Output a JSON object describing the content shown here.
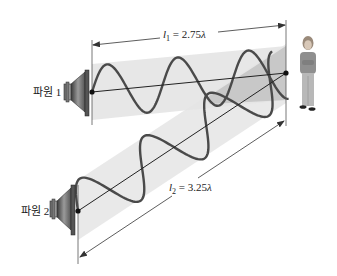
{
  "sources": [
    {
      "id": "source-1",
      "label": "파원 1"
    },
    {
      "id": "source-2",
      "label": "파원 2"
    }
  ],
  "dimensions": {
    "l1": {
      "var": "l",
      "sub": "1",
      "eq": " = 2.75",
      "unit": "λ"
    },
    "l2": {
      "var": "l",
      "sub": "2",
      "eq": " = 3.25",
      "unit": "λ"
    }
  },
  "listener": {
    "label": "listener"
  },
  "colors": {
    "beam": "#e6e6e6",
    "beam_overlap": "#c4c4c4",
    "wave": "#4a4a4a",
    "line": "#222222"
  }
}
